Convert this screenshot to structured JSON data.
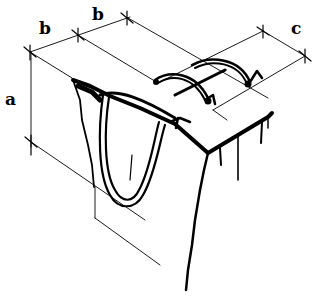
{
  "diagram": {
    "dimension_labels": {
      "a": "a",
      "b1": "b",
      "b2": "b",
      "c": "c"
    },
    "colors": {
      "ink": "#000000",
      "background": "#ffffff"
    }
  }
}
